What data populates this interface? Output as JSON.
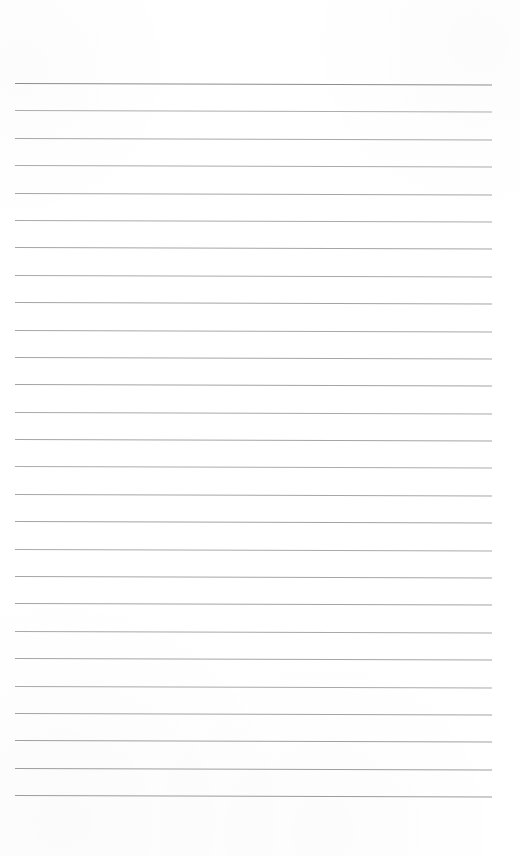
{
  "document": {
    "kind": "ruled-paper",
    "title": "Lined Notepad Page",
    "body_text": "",
    "page_width": 520,
    "page_height": 856,
    "background_color": "#ffffff"
  },
  "ruling": {
    "line_count": 27,
    "first_line_y": 83,
    "line_spacing": 27.4,
    "line_left_x": 15,
    "line_right_x": 492,
    "line_width": 477,
    "header_rule_color": "#8d8d8d",
    "body_rule_color": "#aaaaaa",
    "header_rule_thickness": 1.4,
    "body_rule_thickness": 1,
    "slope_px": 1.5,
    "top_margin": 83,
    "bottom_margin": 61
  },
  "lines": [
    {
      "index": 1,
      "y": 83.0,
      "color": "#8d8d8d",
      "thickness": 1.4,
      "content": ""
    },
    {
      "index": 2,
      "y": 110.4,
      "color": "#adadad",
      "thickness": 1,
      "content": ""
    },
    {
      "index": 3,
      "y": 137.8,
      "color": "#a8a8a8",
      "thickness": 1,
      "content": ""
    },
    {
      "index": 4,
      "y": 165.2,
      "color": "#ababab",
      "thickness": 1,
      "content": ""
    },
    {
      "index": 5,
      "y": 192.5,
      "color": "#a6a6a6",
      "thickness": 1,
      "content": ""
    },
    {
      "index": 6,
      "y": 219.9,
      "color": "#aaaaaa",
      "thickness": 1,
      "content": ""
    },
    {
      "index": 7,
      "y": 247.3,
      "color": "#a5a5a5",
      "thickness": 1,
      "content": ""
    },
    {
      "index": 8,
      "y": 274.7,
      "color": "#a9a9a9",
      "thickness": 1,
      "content": ""
    },
    {
      "index": 9,
      "y": 302.1,
      "color": "#a4a4a4",
      "thickness": 1,
      "content": ""
    },
    {
      "index": 10,
      "y": 329.5,
      "color": "#a8a8a8",
      "thickness": 1,
      "content": ""
    },
    {
      "index": 11,
      "y": 356.8,
      "color": "#a6a6a6",
      "thickness": 1,
      "content": ""
    },
    {
      "index": 12,
      "y": 384.2,
      "color": "#a3a3a3",
      "thickness": 1,
      "content": ""
    },
    {
      "index": 13,
      "y": 411.6,
      "color": "#a9a9a9",
      "thickness": 1,
      "content": ""
    },
    {
      "index": 14,
      "y": 439.0,
      "color": "#a5a5a5",
      "thickness": 1,
      "content": ""
    },
    {
      "index": 15,
      "y": 466.4,
      "color": "#acacac",
      "thickness": 1,
      "content": ""
    },
    {
      "index": 16,
      "y": 493.8,
      "color": "#a7a7a7",
      "thickness": 1,
      "content": ""
    },
    {
      "index": 17,
      "y": 521.2,
      "color": "#a3a3a3",
      "thickness": 1,
      "content": ""
    },
    {
      "index": 18,
      "y": 548.5,
      "color": "#aaaaaa",
      "thickness": 1,
      "content": ""
    },
    {
      "index": 19,
      "y": 575.9,
      "color": "#a6a6a6",
      "thickness": 1,
      "content": ""
    },
    {
      "index": 20,
      "y": 603.3,
      "color": "#a4a4a4",
      "thickness": 1,
      "content": ""
    },
    {
      "index": 21,
      "y": 630.7,
      "color": "#a8a8a8",
      "thickness": 1,
      "content": ""
    },
    {
      "index": 22,
      "y": 658.1,
      "color": "#a5a5a5",
      "thickness": 1,
      "content": ""
    },
    {
      "index": 23,
      "y": 685.5,
      "color": "#a9a9a9",
      "thickness": 1,
      "content": ""
    },
    {
      "index": 24,
      "y": 712.8,
      "color": "#a4a4a4",
      "thickness": 1,
      "content": ""
    },
    {
      "index": 25,
      "y": 740.2,
      "color": "#a0a0a0",
      "thickness": 1,
      "content": ""
    },
    {
      "index": 26,
      "y": 767.6,
      "color": "#9e9e9e",
      "thickness": 1,
      "content": ""
    },
    {
      "index": 27,
      "y": 795.0,
      "color": "#9c9c9c",
      "thickness": 1,
      "content": ""
    }
  ]
}
